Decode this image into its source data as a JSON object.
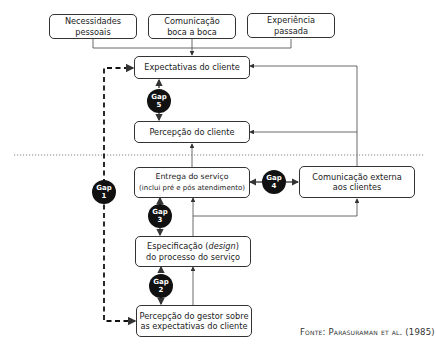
{
  "diagram": {
    "type": "gap-model",
    "nodes": {
      "necessidades": "Necessidades pessoais",
      "necessidades_l1": "Necessidades",
      "necessidades_l2": "pessoais",
      "comunicacao_boca_l1": "Comunicação",
      "comunicacao_boca_l2": "boca a boca",
      "experiencia_l1": "Experiência",
      "experiencia_l2": "passada",
      "expectativas": "Expectativas do cliente",
      "percepcao_cliente": "Percepção do cliente",
      "entrega_l1": "Entrega do serviço",
      "entrega_l2": "(inclui pré e pós atendimento)",
      "comunicacao_externa_l1": "Comunicação externa",
      "comunicacao_externa_l2": "aos clientes",
      "especificacao_l1a": "Especificação (",
      "especificacao_l1b": "design",
      "especificacao_l1c": ")",
      "especificacao_l2": "do processo do serviço",
      "percepcao_gestor_l1": "Percepção do gestor sobre",
      "percepcao_gestor_l2": "as expectativas do cliente"
    },
    "gaps": [
      {
        "label": "Gap",
        "number": "1"
      },
      {
        "label": "Gap",
        "number": "2"
      },
      {
        "label": "Gap",
        "number": "3"
      },
      {
        "label": "Gap",
        "number": "4"
      },
      {
        "label": "Gap",
        "number": "5"
      }
    ],
    "source_prefix": "Fonte: ",
    "source_name": "Parasuraman et al.",
    "source_year": " (1985)"
  }
}
